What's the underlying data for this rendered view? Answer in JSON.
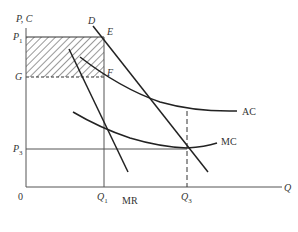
{
  "diagram": {
    "type": "monopoly cost and revenue diagram",
    "axes": {
      "y_label": "P, C",
      "x_label": "Q",
      "origin": "0"
    },
    "price_levels": {
      "P1": {
        "main": "P",
        "sub": "1"
      },
      "G": "G",
      "P3": {
        "main": "P",
        "sub": "3"
      }
    },
    "quantity_levels": {
      "Q1": {
        "main": "Q",
        "sub": "1"
      },
      "Q3": {
        "main": "Q",
        "sub": "3"
      }
    },
    "curves": {
      "demand": "D",
      "marginal_revenue": "MR",
      "average_cost": "AC",
      "marginal_cost": "MC"
    },
    "points": {
      "E": "E",
      "F": "F"
    },
    "shaded_region": "profit rectangle P1-E-F-G (hatched)",
    "colors": {
      "line": "#333333",
      "axis": "#555555",
      "background": "#ffffff"
    }
  }
}
